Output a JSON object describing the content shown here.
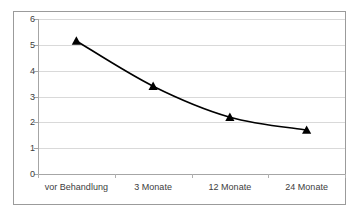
{
  "chart_data": {
    "type": "line",
    "title": "",
    "subtitle": "",
    "xlabel": "",
    "ylabel": "",
    "categories": [
      "vor Behandlung",
      "3 Monate",
      "12 Monate",
      "24 Monate"
    ],
    "values": [
      5.15,
      3.4,
      2.2,
      1.7
    ],
    "series": [
      {
        "name": "",
        "values": [
          5.15,
          3.4,
          2.2,
          1.7
        ]
      }
    ],
    "ylim": [
      0,
      6
    ],
    "y_ticks": [
      0,
      1,
      2,
      3,
      4,
      5,
      6
    ],
    "y_tick_labels": [
      "0",
      "1",
      "2",
      "3",
      "4",
      "5",
      "6"
    ],
    "grid": true,
    "grid_axis": "y",
    "legend": false,
    "legend_position": "none",
    "marker": "triangle",
    "marker_color": "#000000",
    "line_color": "#000000",
    "line_smooth": true,
    "gridline_color": "#d9d9d9",
    "axis_color": "#a6a6a6",
    "frame_color": "#9b9b9b",
    "background_color": "#ffffff",
    "annotations": []
  }
}
